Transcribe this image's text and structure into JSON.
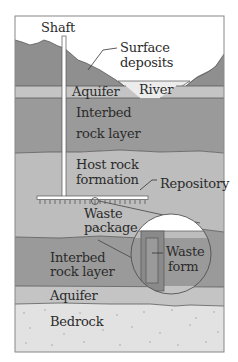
{
  "diagram": {
    "colors": {
      "sky": "#ffffff",
      "surface": "#8f8f8f",
      "aquifer": "#c4c4c4",
      "interbed": "#9a9a9a",
      "host_rock": "#bdbdbd",
      "bedrock": "#e2e2e2",
      "river": "#ececec",
      "frame": "#555555",
      "waste_form": "#8a8a8a"
    },
    "labels": {
      "shaft": "Shaft",
      "surface_1": "Surface",
      "surface_2": "deposits",
      "river": "River",
      "aquifer_top": "Aquifer",
      "interbed_top_1": "Interbed",
      "interbed_top_2": "rock layer",
      "host_1": "Host rock",
      "host_2": "formation",
      "repository": "Repository",
      "waste_pkg_1": "Waste",
      "waste_pkg_2": "package",
      "waste_form_1": "Waste",
      "waste_form_2": "form",
      "interbed_bottom_1": "Interbed",
      "interbed_bottom_2": "rock layer",
      "aquifer_bottom": "Aquifer",
      "bedrock": "Bedrock"
    }
  }
}
